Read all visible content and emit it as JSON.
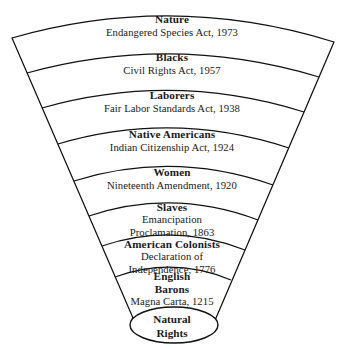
{
  "diagram": {
    "type": "fan-wedge",
    "stroke_color": "#111111",
    "background_color": "#ffffff",
    "core": {
      "shape": "ellipse",
      "line1": "Natural",
      "line2": "Rights"
    },
    "bands": [
      {
        "group": "Nature",
        "document": "Endangered Species Act, 1973",
        "year": "1973"
      },
      {
        "group": "Blacks",
        "document": "Civil Rights Act, 1957",
        "year": "1957"
      },
      {
        "group": "Laborers",
        "document": "Fair Labor Standards Act, 1938",
        "year": "1938"
      },
      {
        "group": "Native Americans",
        "document": "Indian Citizenship Act, 1924",
        "year": "1924"
      },
      {
        "group": "Women",
        "document": "Nineteenth Amendment, 1920",
        "year": "1920"
      },
      {
        "group": "Slaves",
        "document_line1": "Emancipation",
        "document_line2": "Proclamation, 1863",
        "year": "1863"
      },
      {
        "group": "American Colonists",
        "document_line1": "Declaration of",
        "document_line2": "Independence, 1776",
        "year": "1776"
      },
      {
        "group_line1": "English",
        "group_line2": "Barons",
        "document": "Magna Carta, 1215",
        "year": "1215"
      }
    ]
  }
}
